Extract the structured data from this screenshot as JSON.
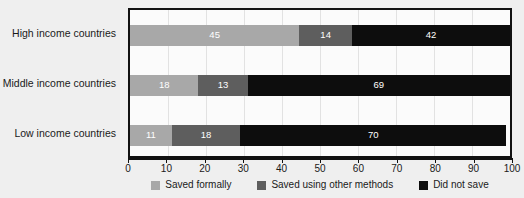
{
  "chart_data": {
    "type": "bar",
    "orientation": "horizontal",
    "stacked": true,
    "title": "",
    "xlabel": "",
    "ylabel": "",
    "xlim": [
      0,
      100
    ],
    "xticks": [
      0,
      10,
      20,
      30,
      40,
      50,
      60,
      70,
      80,
      90,
      100
    ],
    "xtick_labels": [
      "0",
      "10",
      "20",
      "30",
      "40",
      "50",
      "60",
      "70",
      "80",
      "90",
      "100"
    ],
    "grid": true,
    "legend_position": "bottom",
    "categories": [
      "High income countries",
      "Middle income countries",
      "Low income countries"
    ],
    "series": [
      {
        "name": "Saved formally",
        "color": "#a8a8a8",
        "values": [
          45,
          18,
          11
        ],
        "labels": [
          "45",
          "18",
          "11"
        ]
      },
      {
        "name": "Saved using other methods",
        "color": "#5e5e5e",
        "values": [
          14,
          13,
          18
        ],
        "labels": [
          "14",
          "13",
          "18"
        ]
      },
      {
        "name": "Did not save",
        "color": "#0d0d0d",
        "values": [
          42,
          69,
          70
        ],
        "labels": [
          "42",
          "69",
          "70"
        ]
      }
    ]
  },
  "colors": {
    "background": "#efefef",
    "plot_background": "#fbfbfb",
    "frame": "#111111",
    "gridline": "#e2e2e2",
    "text": "#1a1a1a",
    "value_label": "#ffffff"
  }
}
